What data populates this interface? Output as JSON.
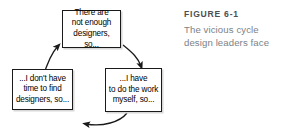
{
  "figure": {
    "label": "FIGURE 6-1",
    "caption_lines": [
      "The vicious cycle",
      "design leaders face"
    ],
    "caption_full": "The vicious cycle design leaders face"
  },
  "diagram": {
    "type": "cycle",
    "direction": "clockwise",
    "nodes": [
      {
        "id": "not-enough-designers",
        "position": "top",
        "text": "There are\nnot enough\ndesigners, so..."
      },
      {
        "id": "do-work-myself",
        "position": "bottom-right",
        "text": "...I have\nto do the work\nmyself, so..."
      },
      {
        "id": "no-time-to-find",
        "position": "bottom-left",
        "text": "...I don't have\ntime to find\ndesigners, so..."
      }
    ],
    "arrows": [
      {
        "id": "arrow-top-to-right",
        "from": "not-enough-designers",
        "to": "do-work-myself"
      },
      {
        "id": "arrow-right-to-left",
        "from": "do-work-myself",
        "to": "no-time-to-find"
      },
      {
        "id": "arrow-left-to-top",
        "from": "no-time-to-find",
        "to": "not-enough-designers"
      }
    ]
  },
  "colors": {
    "box_border": "#1a1a1a",
    "box_shadow": "#d8d8d8",
    "box_text": "#000000",
    "arrow": "#1a1a1a",
    "caption_label": "#4a4f54",
    "caption_text": "#7c8287",
    "background": "#ffffff"
  }
}
